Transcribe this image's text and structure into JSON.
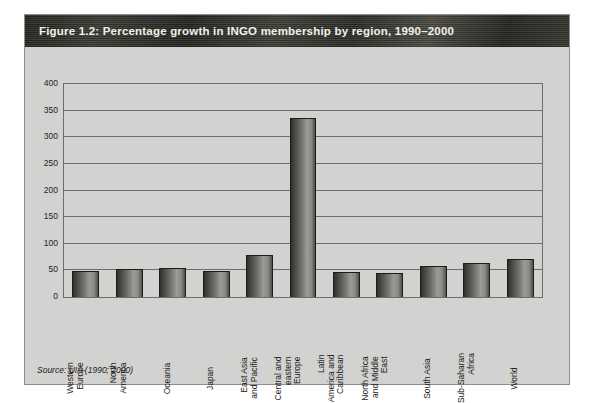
{
  "figure": {
    "title": "Figure 1.2: Percentage growth in INGO membership by region, 1990–2000",
    "source_note": "Source: UIA (1990; 2000)",
    "frame_color": "#d2d2d0",
    "title_band_color": "#2a2a26",
    "bar_color_dark": "#2f2f2d",
    "bar_color_light": "#9a9a96"
  },
  "chart_data": {
    "type": "bar",
    "title": "Figure 1.2: Percentage growth in INGO membership by region, 1990–2000",
    "xlabel": "",
    "ylabel": "",
    "ylim": [
      0,
      400
    ],
    "yticks": [
      0,
      50,
      100,
      150,
      200,
      250,
      300,
      350,
      400
    ],
    "ytick_labels": [
      "0",
      "50",
      "100",
      "150",
      "200",
      "250",
      "300",
      "350",
      "400"
    ],
    "grid": true,
    "legend": false,
    "categories": [
      "Western Europe",
      "North America",
      "Oceania",
      "Japan",
      "East Asia and Pacific",
      "Central and eastern Europe",
      "Latin America and Caribbean",
      "North Africa and Middle East",
      "South Asia",
      "Sub-Saharan Africa",
      "World"
    ],
    "category_lines": [
      [
        "Western",
        "Europe"
      ],
      [
        "North",
        "America"
      ],
      [
        "Oceania"
      ],
      [
        "Japan"
      ],
      [
        "East Asia",
        "and Pacific"
      ],
      [
        "Central and",
        "eastern",
        "Europe"
      ],
      [
        "Latin",
        "America and",
        "Caribbean"
      ],
      [
        "North Africa",
        "and Middle",
        "East"
      ],
      [
        "South Asia"
      ],
      [
        "Sub-Saharan",
        "Africa"
      ],
      [
        "World"
      ]
    ],
    "values": [
      48,
      52,
      54,
      48,
      78,
      337,
      47,
      45,
      58,
      63,
      72
    ]
  }
}
